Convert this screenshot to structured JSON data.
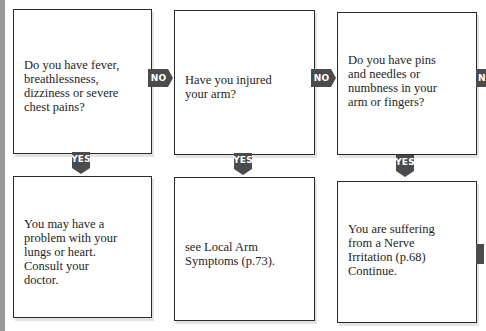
{
  "flowchart": {
    "questions": [
      {
        "id": "q1",
        "text": "Do you have fever,\nbreathlessness,\ndizziness or severe\nchest pains?"
      },
      {
        "id": "q2",
        "text": "Have you injured\nyour arm?"
      },
      {
        "id": "q3",
        "text": "Do you have pins\nand needles or\nnumbness in your\narm or fingers?"
      }
    ],
    "outcomes": [
      {
        "id": "o1",
        "text": "You may have a\nproblem with your\nlungs or heart.\nConsult your\ndoctor."
      },
      {
        "id": "o2",
        "text": "see Local Arm\nSymptoms (p.73)."
      },
      {
        "id": "o3",
        "text": "You are suffering\nfrom a Nerve\nIrritation (p.68)\nContinue."
      }
    ],
    "labels": {
      "no": "NO",
      "yes": "YES",
      "no_partial": "N"
    },
    "colors": {
      "badge": "#4b4b4b",
      "badge_text": "#ffffff",
      "border": "#2a2a2a"
    }
  }
}
